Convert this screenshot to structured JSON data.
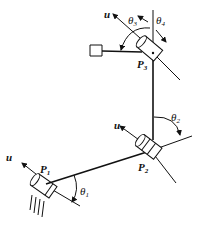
{
  "diagram": {
    "type": "robot-arm-kinematics",
    "joints": [
      {
        "id": "P1",
        "label_main": "P",
        "label_sub": "1",
        "angle_main": "θ",
        "angle_sub": "1",
        "axis_label": "u"
      },
      {
        "id": "P2",
        "label_main": "P",
        "label_sub": "2",
        "angle_main": "θ",
        "angle_sub": "2",
        "axis_label": "u"
      },
      {
        "id": "P3",
        "label_main": "P",
        "label_sub": "3",
        "angle_main": "θ",
        "angle_sub": "3",
        "axis_label": "u"
      }
    ],
    "extra_angle": {
      "main": "θ",
      "sub": "4"
    },
    "colors": {
      "stroke": "#111111",
      "background": "#ffffff"
    }
  }
}
